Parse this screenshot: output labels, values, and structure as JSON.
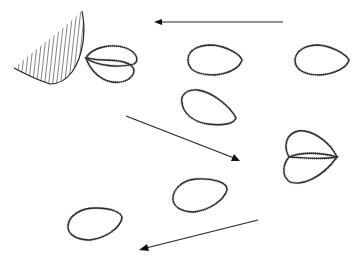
{
  "figure": {
    "colors": {
      "background": "#ffffff",
      "ink": "#222222",
      "cilia": "#777777"
    }
  },
  "wedge": {
    "label": "hatched-structure"
  },
  "cells": [
    {
      "id": "cell-pair-top-left",
      "type": "overlapping-pair"
    },
    {
      "id": "cell-top-center",
      "type": "single"
    },
    {
      "id": "cell-top-right",
      "type": "single"
    },
    {
      "id": "cell-middle-center",
      "type": "single"
    },
    {
      "id": "cell-pair-right",
      "type": "overlapping-pair"
    },
    {
      "id": "cell-lower-center",
      "type": "single"
    },
    {
      "id": "cell-bottom-left",
      "type": "single"
    }
  ],
  "arrows": [
    {
      "id": "arrow-top",
      "direction": "left"
    },
    {
      "id": "arrow-middle",
      "direction": "down-right"
    },
    {
      "id": "arrow-bottom",
      "direction": "down-left"
    }
  ]
}
